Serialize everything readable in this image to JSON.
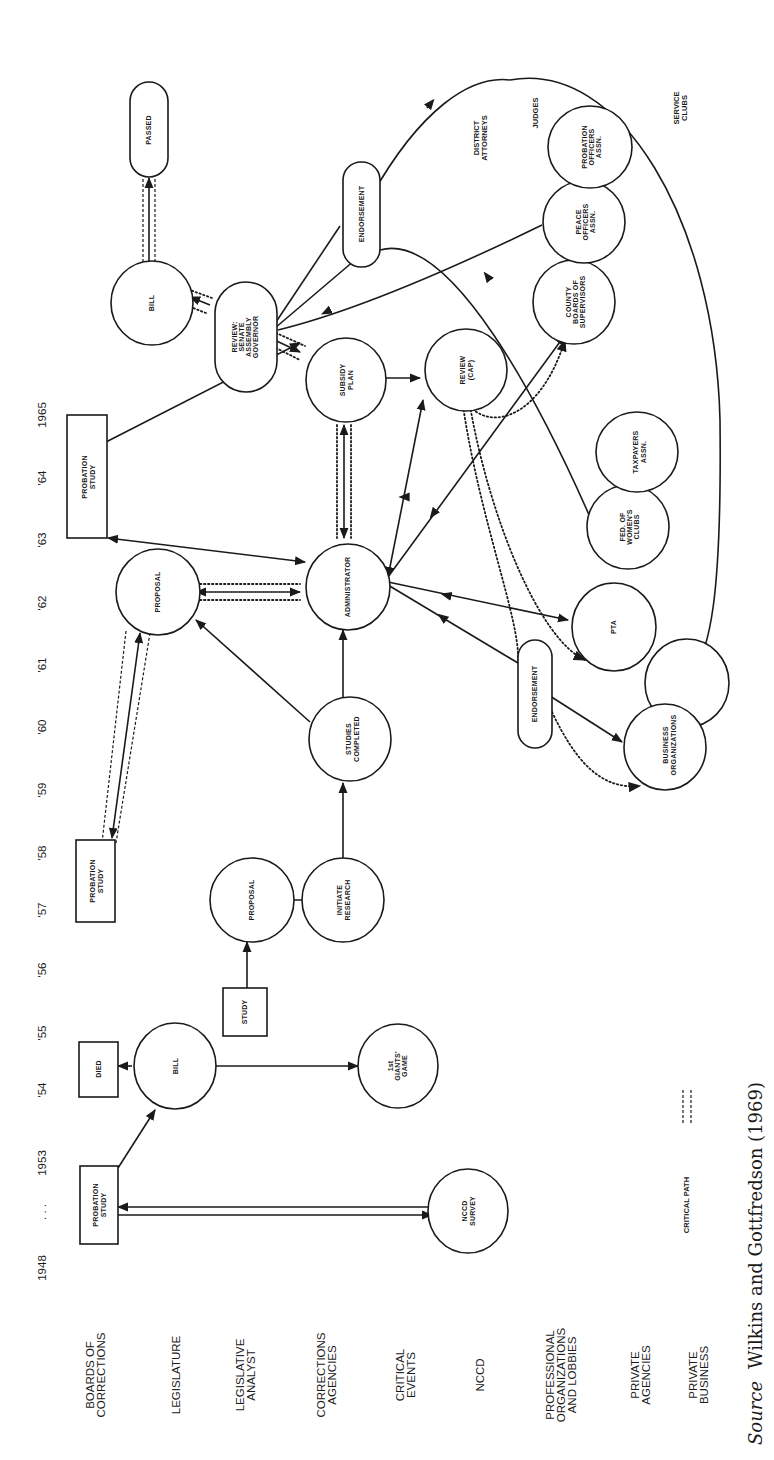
{
  "figure": {
    "orientation": "rotated 90 degrees counter-clockwise",
    "timeline": {
      "years": [
        "1948",
        ". . .",
        "1953",
        "'54",
        "'55",
        "'56",
        "'57",
        "'58",
        "'59",
        "'60",
        "'61",
        "'62",
        "'63",
        "'64",
        "1965"
      ]
    },
    "rows": [
      {
        "id": "boards",
        "lines": [
          "BOARDS OF",
          "CORRECTIONS"
        ]
      },
      {
        "id": "legislature",
        "lines": [
          "LEGISLATURE"
        ]
      },
      {
        "id": "analyst",
        "lines": [
          "LEGISLATIVE",
          "ANALYST"
        ]
      },
      {
        "id": "agencies",
        "lines": [
          "CORRECTIONS",
          "AGENCIES"
        ]
      },
      {
        "id": "events",
        "lines": [
          "CRITICAL",
          "EVENTS"
        ]
      },
      {
        "id": "nccd",
        "lines": [
          "NCCD"
        ]
      },
      {
        "id": "proforgs",
        "lines": [
          "PROFESSIONAL",
          "ORGANIZATIONS",
          "AND LOBBIES"
        ]
      },
      {
        "id": "privagencies",
        "lines": [
          "PRIVATE",
          "AGENCIES"
        ]
      },
      {
        "id": "privbusiness",
        "lines": [
          "PRIVATE",
          "BUSINESS"
        ]
      }
    ],
    "nodes": {
      "probation_study_1953": [
        "PROBATION",
        "STUDY"
      ],
      "nccd_survey": [
        "NCCD",
        "SURVEY"
      ],
      "bill_1954": [
        "BILL"
      ],
      "died": [
        "DIED"
      ],
      "giants_game": [
        "1st",
        "GIANTS'",
        "GAME"
      ],
      "study_1956": [
        "STUDY"
      ],
      "proposal_1957": [
        "PROPOSAL"
      ],
      "initiate_research": [
        "INITIATE",
        "RESEARCH"
      ],
      "probation_study_1958": [
        "PROBATION",
        "STUDY"
      ],
      "studies_completed": [
        "STUDIES",
        "COMPLETED"
      ],
      "proposal_1962": [
        "PROPOSAL"
      ],
      "administrator": [
        "ADMINISTRATOR"
      ],
      "endorsement_lower": [
        "ENDORSEMENT"
      ],
      "business_orgs": [
        "BUSINESS",
        "ORGANIZATIONS"
      ],
      "pta": [
        "PTA"
      ],
      "fed_womens_clubs": [
        "FED. OF",
        "WOMEN'S",
        "CLUBS"
      ],
      "taxpayers": [
        "TAXPAYERS",
        "ASSN."
      ],
      "probation_study_1963": [
        "PROBATION",
        "STUDY"
      ],
      "subsidy_plan": [
        "SUBSIDY",
        "PLAN"
      ],
      "review_cap": [
        "REVIEW",
        "(CAP)"
      ],
      "review_legislature": [
        "REVIEW:",
        "SENATE",
        "ASSEMBLY",
        "GOVERNOR"
      ],
      "bill_1965": [
        "BILL"
      ],
      "passed": [
        "PASSED"
      ],
      "endorsement_upper": [
        "ENDORSEMENT"
      ],
      "county_boards": [
        "COUNTY",
        "BOARDS OF",
        "SUPERVISORS"
      ],
      "peace_officers": [
        "PEACE",
        "OFFICERS",
        "ASSN."
      ],
      "probation_officers": [
        "PROBATION",
        "OFFICERS",
        "ASSN."
      ]
    },
    "annotations": {
      "district_attorneys": [
        "DISTRICT",
        "ATTORNEYS"
      ],
      "judges": [
        "JUDGES"
      ],
      "service_clubs": [
        "SERVICE",
        "CLUBS"
      ]
    },
    "legend": {
      "label": "CRITICAL PATH"
    },
    "source": {
      "prefix": "Source",
      "text": "Wilkins and Gottfredson (1969)"
    }
  }
}
